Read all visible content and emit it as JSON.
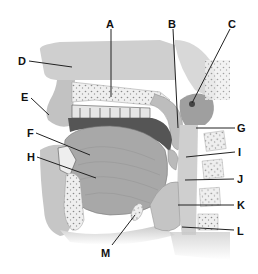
{
  "diagram": {
    "labels": [
      {
        "id": "A",
        "text": "A",
        "x": 110,
        "y": 25,
        "line": [
          111,
          29,
          111,
          97
        ]
      },
      {
        "id": "B",
        "text": "B",
        "x": 172,
        "y": 25,
        "line": [
          173,
          29,
          178,
          128
        ]
      },
      {
        "id": "C",
        "text": "C",
        "x": 232,
        "y": 25,
        "line": [
          230,
          29,
          192,
          103
        ]
      },
      {
        "id": "D",
        "text": "D",
        "x": 19,
        "y": 64,
        "line": [
          29,
          61,
          72,
          67
        ]
      },
      {
        "id": "E",
        "text": "E",
        "x": 21,
        "y": 101,
        "line": [
          31,
          98,
          49,
          115
        ]
      },
      {
        "id": "F",
        "text": "F",
        "x": 27,
        "y": 136,
        "line": [
          36,
          133,
          90,
          155
        ]
      },
      {
        "id": "H",
        "text": "H",
        "x": 27,
        "y": 160,
        "line": [
          37,
          157,
          96,
          178
        ]
      },
      {
        "id": "G",
        "text": "G",
        "x": 238,
        "y": 132,
        "line": [
          196,
          128,
          235,
          128
        ]
      },
      {
        "id": "I",
        "text": "I",
        "x": 238,
        "y": 155,
        "line": [
          186,
          157,
          235,
          152
        ]
      },
      {
        "id": "J",
        "text": "J",
        "x": 237,
        "y": 182,
        "line": [
          185,
          180,
          234,
          179
        ]
      },
      {
        "id": "K",
        "text": "K",
        "x": 237,
        "y": 208,
        "line": [
          178,
          205,
          234,
          205
        ]
      },
      {
        "id": "L",
        "text": "L",
        "x": 237,
        "y": 234,
        "line": [
          182,
          227,
          234,
          230
        ]
      },
      {
        "id": "M",
        "text": "M",
        "x": 101,
        "y": 256,
        "line": [
          112,
          245,
          135,
          215
        ]
      }
    ]
  },
  "colors": {
    "background": "#ffffff",
    "tissue_light": "#d6d6d6",
    "tissue_mid": "#b8b8b8",
    "tissue_dark": "#8a8a8a",
    "bone": "#f0f0f0",
    "cavity": "#555555",
    "label": "#111111"
  }
}
